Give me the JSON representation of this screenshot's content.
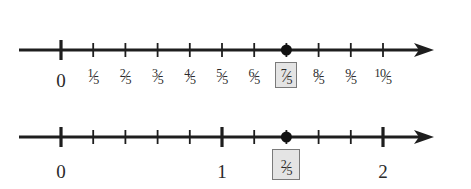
{
  "colors": {
    "line": "#1e1e1e",
    "label_text": "#2a2a2a",
    "highlight_fill": "#e4e4e4",
    "highlight_border": "#7a7a7a",
    "point": "#111111"
  },
  "number_lines": [
    {
      "id": "fifths-line",
      "y": 50,
      "x_start": 19,
      "x_end": 434,
      "origin_x": 61,
      "unit_px": 161,
      "ticks": [
        {
          "value": 0,
          "major": true,
          "label_type": "int",
          "label": "0"
        },
        {
          "value": 0.2,
          "major": false,
          "label_type": "frac",
          "num": "1",
          "den": "5"
        },
        {
          "value": 0.4,
          "major": false,
          "label_type": "frac",
          "num": "2",
          "den": "5"
        },
        {
          "value": 0.6,
          "major": false,
          "label_type": "frac",
          "num": "3",
          "den": "5"
        },
        {
          "value": 0.8,
          "major": false,
          "label_type": "frac",
          "num": "4",
          "den": "5"
        },
        {
          "value": 1.0,
          "major": false,
          "label_type": "frac",
          "num": "5",
          "den": "5"
        },
        {
          "value": 1.2,
          "major": false,
          "label_type": "frac",
          "num": "6",
          "den": "5"
        },
        {
          "value": 1.4,
          "major": false,
          "label_type": "frac",
          "num": "7",
          "den": "5",
          "highlighted": true
        },
        {
          "value": 1.6,
          "major": false,
          "label_type": "frac",
          "num": "8",
          "den": "5"
        },
        {
          "value": 1.8,
          "major": false,
          "label_type": "frac",
          "num": "9",
          "den": "5"
        },
        {
          "value": 2.0,
          "major": false,
          "label_type": "frac",
          "num": "10",
          "den": "5"
        }
      ],
      "point": {
        "value": 1.4,
        "label": "7/5"
      },
      "label_y": 66
    },
    {
      "id": "mixed-number-line",
      "y": 137,
      "x_start": 19,
      "x_end": 434,
      "origin_x": 61,
      "unit_px": 161,
      "ticks": [
        {
          "value": 0,
          "major": true,
          "label_type": "int",
          "label": "0"
        },
        {
          "value": 0.2,
          "major": false
        },
        {
          "value": 0.4,
          "major": false
        },
        {
          "value": 0.6,
          "major": false
        },
        {
          "value": 0.8,
          "major": false
        },
        {
          "value": 1.0,
          "major": true,
          "label_type": "int",
          "label": "1"
        },
        {
          "value": 1.2,
          "major": false
        },
        {
          "value": 1.4,
          "major": false,
          "label_type": "frac",
          "num": "2",
          "den": "5",
          "highlighted": true
        },
        {
          "value": 1.6,
          "major": false
        },
        {
          "value": 1.8,
          "major": false
        },
        {
          "value": 2.0,
          "major": true,
          "label_type": "int",
          "label": "2"
        }
      ],
      "point": {
        "value": 1.4,
        "label": "2/5"
      },
      "label_y": 157
    }
  ]
}
